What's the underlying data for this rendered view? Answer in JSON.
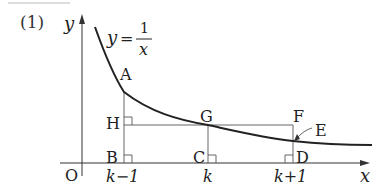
{
  "problem_label": "(1)",
  "curve_label": {
    "lhs": "y",
    "eq": "=",
    "num": "1",
    "den": "x"
  },
  "axes": {
    "x": "x",
    "y": "y",
    "origin": "O"
  },
  "points": {
    "A": "A",
    "B": "B",
    "C": "C",
    "D": "D",
    "E": "E",
    "F": "F",
    "G": "G",
    "H": "H"
  },
  "ticks": {
    "k_minus_1": "k−1",
    "k": "k",
    "k_plus_1": "k+1"
  },
  "colors": {
    "curve": "#222222",
    "lines": "#555555",
    "text": "#222222"
  }
}
